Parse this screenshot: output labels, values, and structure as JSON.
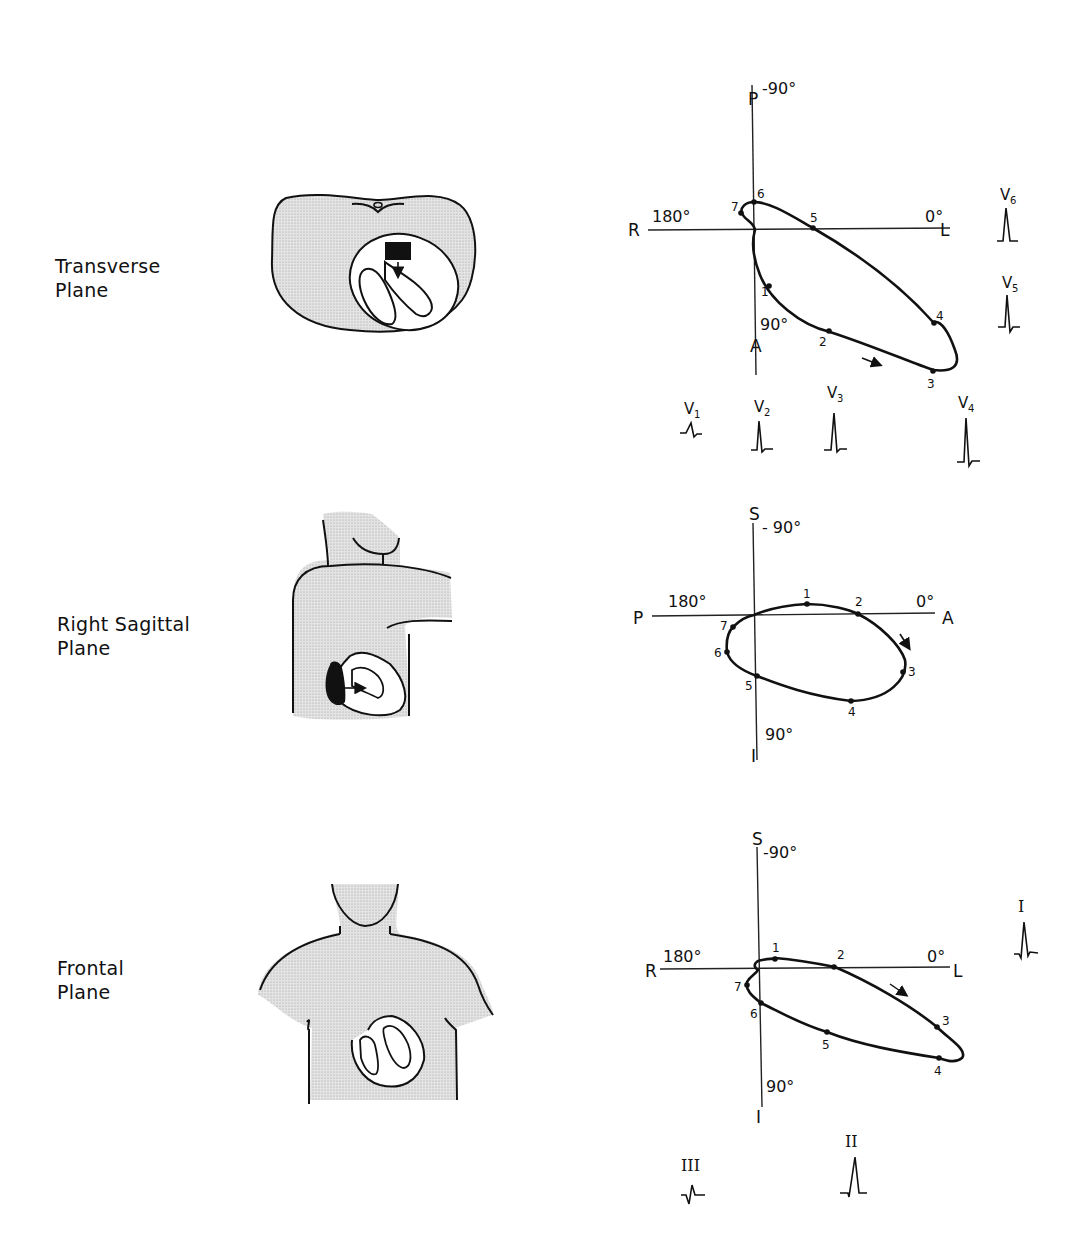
{
  "planes": [
    {
      "name": "transverse",
      "label_line1": "Transverse",
      "label_line2": "Plane",
      "axes": {
        "top_letter": "P",
        "top_angle": "-90°",
        "left_letter": "R",
        "left_angle": "180°",
        "right_letter": "L",
        "right_angle": "0°",
        "bottom_letter": "A",
        "bottom_angle": "90°"
      },
      "points": [
        "1",
        "2",
        "3",
        "4",
        "5",
        "6",
        "7"
      ],
      "leads": [
        {
          "label": "V",
          "sub": "1"
        },
        {
          "label": "V",
          "sub": "2"
        },
        {
          "label": "V",
          "sub": "3"
        },
        {
          "label": "V",
          "sub": "4"
        },
        {
          "label": "V",
          "sub": "5"
        },
        {
          "label": "V",
          "sub": "6"
        }
      ]
    },
    {
      "name": "right-sagittal",
      "label_line1": "Right Sagittal",
      "label_line2": "Plane",
      "axes": {
        "top_letter": "S",
        "top_angle": "- 90°",
        "left_letter": "P",
        "left_angle": "180°",
        "right_letter": "A",
        "right_angle": "0°",
        "bottom_letter": "I",
        "bottom_angle": "90°"
      },
      "points": [
        "1",
        "2",
        "3",
        "4",
        "5",
        "6",
        "7"
      ]
    },
    {
      "name": "frontal",
      "label_line1": "Frontal",
      "label_line2": "Plane",
      "axes": {
        "top_letter": "S",
        "top_angle": "-90°",
        "left_letter": "R",
        "left_angle": "180°",
        "right_letter": "L",
        "right_angle": "0°",
        "bottom_letter": "I",
        "bottom_angle": "90°"
      },
      "points": [
        "1",
        "2",
        "3",
        "4",
        "5",
        "6",
        "7"
      ],
      "leads": [
        {
          "label": "I"
        },
        {
          "label": "II"
        },
        {
          "label": "III"
        }
      ]
    }
  ]
}
